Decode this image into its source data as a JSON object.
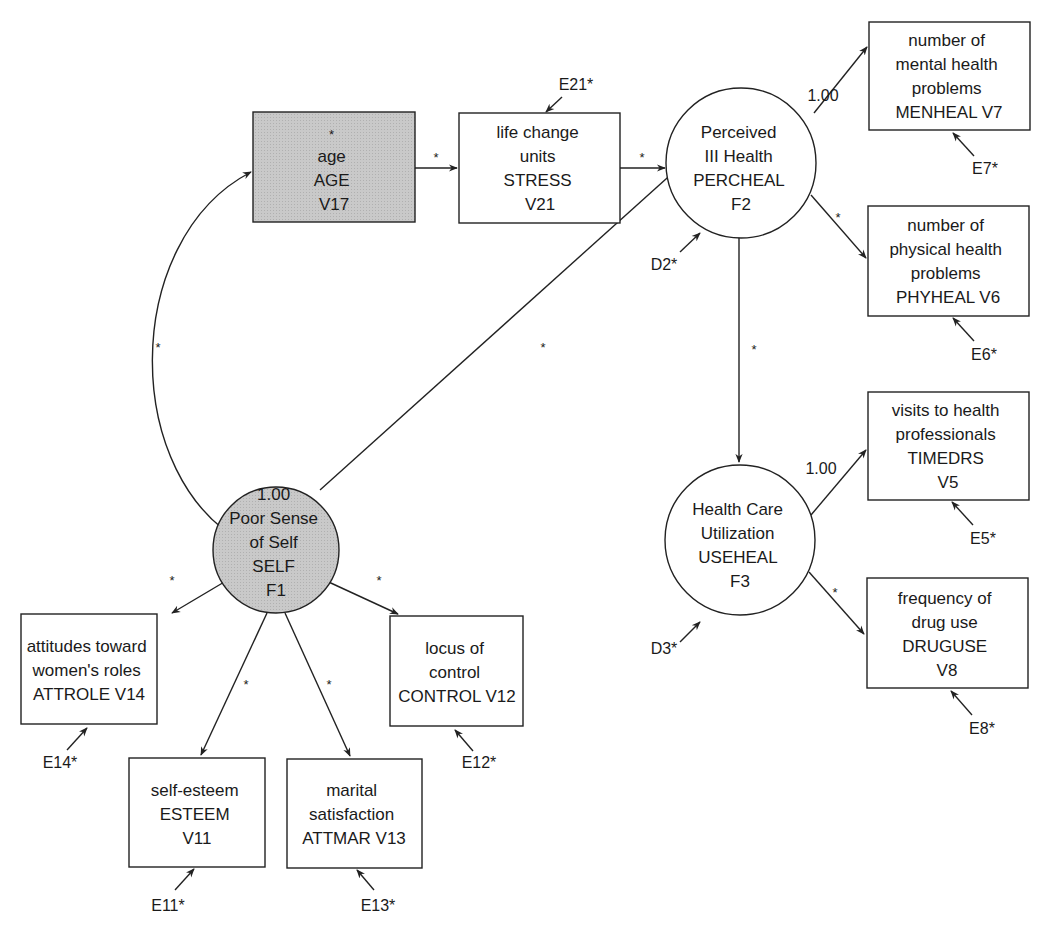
{
  "diagram": {
    "type": "structural-equation-model",
    "colors": {
      "line": "#222222",
      "shaded": "#c8c8c8",
      "background": "#ffffff"
    },
    "nodes": {
      "age": {
        "shape": "rect",
        "shaded": true,
        "lines": [
          "*",
          "age",
          "AGE",
          "V17"
        ]
      },
      "stress": {
        "shape": "rect",
        "shaded": false,
        "lines": [
          "life change",
          "units",
          "STRESS",
          "V21"
        ]
      },
      "percheal": {
        "shape": "circle",
        "shaded": false,
        "lines": [
          "Perceived",
          "III Health",
          "PERCHEAL",
          "F2"
        ]
      },
      "menheal": {
        "shape": "rect",
        "shaded": false,
        "lines": [
          "number of",
          "mental health",
          "problems",
          "MENHEAL V7"
        ]
      },
      "phyheal": {
        "shape": "rect",
        "shaded": false,
        "lines": [
          "number of",
          "physical health",
          "problems",
          "PHYHEAL V6"
        ]
      },
      "timedrs": {
        "shape": "rect",
        "shaded": false,
        "lines": [
          "visits to health",
          "professionals",
          "TIMEDRS",
          "V5"
        ]
      },
      "useheal": {
        "shape": "circle",
        "shaded": false,
        "lines": [
          "Health Care",
          "Utilization",
          "USEHEAL",
          "F3"
        ]
      },
      "druguse": {
        "shape": "rect",
        "shaded": false,
        "lines": [
          "frequency of",
          "drug use",
          "DRUGUSE",
          "V8"
        ]
      },
      "self": {
        "shape": "circle",
        "shaded": true,
        "lines": [
          "1.00",
          "Poor Sense",
          "of Self",
          "SELF",
          "F1"
        ]
      },
      "attrole": {
        "shape": "rect",
        "shaded": false,
        "lines": [
          "attitudes toward",
          "women's roles",
          "ATTROLE V14"
        ]
      },
      "control": {
        "shape": "rect",
        "shaded": false,
        "lines": [
          "locus of",
          "control",
          "CONTROL V12"
        ]
      },
      "esteem": {
        "shape": "rect",
        "shaded": false,
        "lines": [
          "self-esteem",
          "ESTEEM",
          "V11"
        ]
      },
      "attmar": {
        "shape": "rect",
        "shaded": false,
        "lines": [
          "marital",
          "satisfaction",
          "ATTMAR V13"
        ]
      }
    },
    "path_labels": {
      "age_stress": "*",
      "stress_percheal": "*",
      "percheal_menheal": "1.00",
      "percheal_phyheal": "*",
      "percheal_useheal": "*",
      "useheal_timedrs": "1.00",
      "useheal_druguse": "*",
      "self_percheal": "*",
      "self_age_cov": "*",
      "self_attrole": "*",
      "self_control": "*",
      "self_esteem": "*",
      "self_attmar": "*"
    },
    "errors": {
      "e21": "E21*",
      "e7": "E7*",
      "e6": "E6*",
      "e5": "E5*",
      "e8": "E8*",
      "d2": "D2*",
      "d3": "D3*",
      "e14": "E14*",
      "e11": "E11*",
      "e13": "E13*",
      "e12": "E12*"
    }
  }
}
